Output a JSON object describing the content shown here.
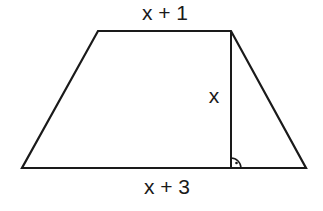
{
  "diagram": {
    "type": "trapezoid",
    "labels": {
      "top": "x + 1",
      "bottom": "x + 3",
      "height": "x"
    },
    "vertices": {
      "top_left": [
        98,
        31
      ],
      "top_right": [
        231,
        31
      ],
      "bottom_right": [
        306,
        168
      ],
      "bottom_left": [
        22,
        168
      ]
    },
    "height_segment": {
      "from": [
        231,
        31
      ],
      "to": [
        231,
        168
      ]
    },
    "right_angle_marker": {
      "center": [
        231,
        168
      ],
      "radius": 10
    },
    "stroke_color": "#1a1a1a",
    "background": "#ffffff"
  }
}
